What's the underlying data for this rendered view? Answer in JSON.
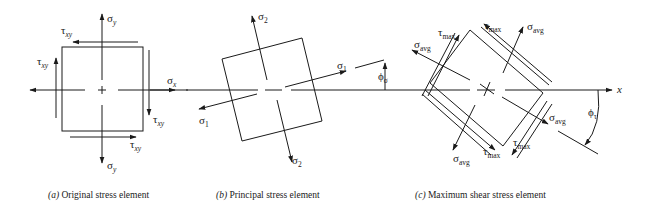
{
  "figure": {
    "axis_label": "x",
    "panels": [
      {
        "id": "a",
        "caption_letter": "(a)",
        "caption_text": " Original stress element",
        "labels": {
          "sigma_y_top": "σ",
          "sigma_y_top_sub": "y",
          "sigma_y_bottom": "σ",
          "sigma_y_bottom_sub": "y",
          "sigma_x": "σ",
          "sigma_x_sub": "x",
          "tau_top": "τ",
          "tau_top_sub": "xy",
          "tau_left": "τ",
          "tau_left_sub": "xy",
          "tau_right": "τ",
          "tau_right_sub": "xy",
          "tau_bottom": "τ",
          "tau_bottom_sub": "xy"
        }
      },
      {
        "id": "b",
        "caption_letter": "(b)",
        "caption_text": " Principal stress element",
        "labels": {
          "sigma2_top": "σ",
          "sigma2_top_sub": "2",
          "sigma2_bottom": "σ",
          "sigma2_bottom_sub": "2",
          "sigma1_right": "σ",
          "sigma1_right_sub": "1",
          "sigma1_left": "σ",
          "sigma1_left_sub": "1",
          "phi_sigma": "ϕ",
          "phi_sigma_sub": "σ"
        }
      },
      {
        "id": "c",
        "caption_letter": "(c)",
        "caption_text": " Maximum shear stress element",
        "labels": {
          "tau_max": "τ",
          "tau_max_sub": "max",
          "sigma_avg": "σ",
          "sigma_avg_sub": "avg",
          "phi_tau": "ϕ",
          "phi_tau_sub": "τ"
        }
      }
    ]
  }
}
